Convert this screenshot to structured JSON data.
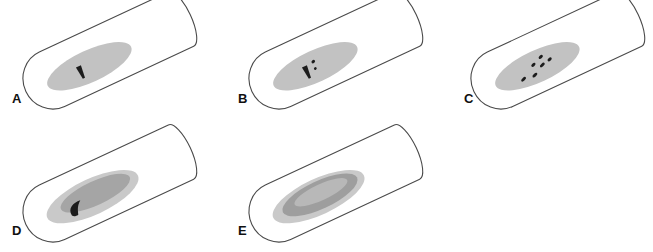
{
  "figure": {
    "title": "",
    "type": "scientific-illustration",
    "background_color": "#ffffff",
    "outline_color": "#3a3a3a",
    "panel_count": 5,
    "rows": 2
  },
  "colors": {
    "tube_outline": "#4a4a4a",
    "tube_fill": "#ffffff",
    "medium_light_gray": "#c9c9c9",
    "medium_gray": "#b0b0b0",
    "inner_gray": "#a8a8a8",
    "ring_gray": "#9a9a9a",
    "mark_dark": "#1c1c1c",
    "mark_dark_soft": "#2a2a2a",
    "label_color": "#101010"
  },
  "panels": [
    {
      "id": "A",
      "label": "A",
      "row": 1,
      "column": 1,
      "label_x": 12,
      "label_y": 103,
      "tube": {
        "cx": 104,
        "cy": 55,
        "length": 170,
        "radius": 30,
        "angle": -25
      },
      "zone_count": 1,
      "zones": [
        {
          "name": "outer-halo",
          "rx": 46,
          "ry": 16,
          "offset_x": -18,
          "offset_y": 4,
          "color": "#c2c2c2"
        }
      ],
      "marks": [
        {
          "name": "colony-streak",
          "shape": "tack",
          "x": -28,
          "y": 6,
          "w": 5,
          "h": 13,
          "color": "#1c1c1c"
        }
      ]
    },
    {
      "id": "B",
      "label": "B",
      "row": 1,
      "column": 2,
      "label_x": 238,
      "label_y": 103,
      "tube": {
        "cx": 330,
        "cy": 55,
        "length": 170,
        "radius": 30,
        "angle": -25
      },
      "zone_count": 1,
      "zones": [
        {
          "name": "outer-halo",
          "rx": 46,
          "ry": 16,
          "offset_x": -18,
          "offset_y": 4,
          "color": "#c2c2c2"
        }
      ],
      "marks": [
        {
          "name": "colony-streak",
          "shape": "tack",
          "x": -28,
          "y": 6,
          "w": 5,
          "h": 13,
          "color": "#1c1c1c"
        },
        {
          "name": "satellite-colony-1",
          "shape": "dot",
          "x": -18,
          "y": -1,
          "w": 4,
          "h": 3,
          "color": "#1c1c1c"
        },
        {
          "name": "satellite-colony-2",
          "shape": "dot",
          "x": -19,
          "y": 6,
          "w": 3,
          "h": 2.5,
          "color": "#1c1c1c"
        }
      ]
    },
    {
      "id": "C",
      "label": "C",
      "row": 1,
      "column": 3,
      "label_x": 464,
      "label_y": 103,
      "tube": {
        "cx": 552,
        "cy": 55,
        "length": 170,
        "radius": 30,
        "angle": -25
      },
      "zone_count": 1,
      "zones": [
        {
          "name": "outer-halo",
          "rx": 46,
          "ry": 16,
          "offset_x": -18,
          "offset_y": 4,
          "color": "#c2c2c2"
        }
      ],
      "marks": [
        {
          "name": "colony-dot-1",
          "shape": "dash",
          "x": -36,
          "y": 10,
          "w": 6,
          "h": 3,
          "color": "#1c1c1c"
        },
        {
          "name": "colony-dot-2",
          "shape": "dash",
          "x": -24,
          "y": 11,
          "w": 6,
          "h": 3,
          "color": "#1c1c1c"
        },
        {
          "name": "colony-dot-3",
          "shape": "dash",
          "x": -21,
          "y": 1,
          "w": 5,
          "h": 3,
          "color": "#1c1c1c"
        },
        {
          "name": "colony-dot-4",
          "shape": "dash",
          "x": -13,
          "y": 5,
          "w": 6,
          "h": 3,
          "color": "#1c1c1c"
        },
        {
          "name": "colony-dot-5",
          "shape": "dash",
          "x": -11,
          "y": -3,
          "w": 5,
          "h": 3,
          "color": "#1c1c1c"
        },
        {
          "name": "colony-dot-6",
          "shape": "dash",
          "x": -4,
          "y": 3,
          "w": 5,
          "h": 3,
          "color": "#1c1c1c"
        }
      ]
    },
    {
      "id": "D",
      "label": "D",
      "row": 2,
      "column": 1,
      "label_x": 12,
      "label_y": 235,
      "tube": {
        "cx": 104,
        "cy": 188,
        "length": 170,
        "radius": 30,
        "angle": -25
      },
      "zone_count": 2,
      "zones": [
        {
          "name": "outer-halo",
          "rx": 50,
          "ry": 18,
          "offset_x": -14,
          "offset_y": 3,
          "color": "#c9c9c9"
        },
        {
          "name": "inner-zone",
          "rx": 38,
          "ry": 12,
          "offset_x": -10,
          "offset_y": 1,
          "color": "#a5a5a5"
        }
      ],
      "marks": [
        {
          "name": "colony-hook",
          "shape": "hook",
          "x": -34,
          "y": 7,
          "w": 16,
          "h": 13,
          "color": "#1c1c1c"
        }
      ]
    },
    {
      "id": "E",
      "label": "E",
      "row": 2,
      "column": 2,
      "label_x": 238,
      "label_y": 235,
      "tube": {
        "cx": 330,
        "cy": 188,
        "length": 170,
        "radius": 30,
        "angle": -25
      },
      "zone_count": 3,
      "zones": [
        {
          "name": "outer-halo",
          "rx": 50,
          "ry": 18,
          "offset_x": -14,
          "offset_y": 3,
          "color": "#c9c9c9"
        },
        {
          "name": "middle-ring",
          "rx": 41,
          "ry": 14,
          "offset_x": -12,
          "offset_y": 2,
          "color": "#9e9e9e"
        },
        {
          "name": "inner-core",
          "rx": 29,
          "ry": 8,
          "offset_x": -10,
          "offset_y": 0,
          "color": "#b8b8b8"
        }
      ],
      "marks": []
    }
  ]
}
